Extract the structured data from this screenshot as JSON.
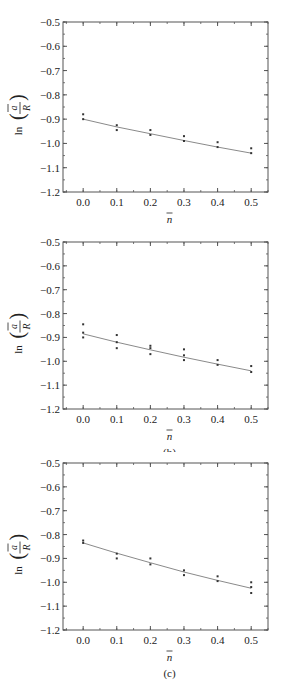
{
  "chart_data": [
    {
      "type": "scatter",
      "panel_label": "(a)",
      "xlabel": "n̄",
      "ylabel": "ln(ā/R)",
      "xlim": [
        -0.06,
        0.55
      ],
      "ylim": [
        -1.2,
        -0.5
      ],
      "x_ticks": [
        "0.0",
        "0.1",
        "0.2",
        "0.3",
        "0.4",
        "0.5"
      ],
      "y_ticks": [
        "-0.5",
        "-0.6",
        "-0.7",
        "-0.8",
        "-0.9",
        "-1.0",
        "-1.1",
        "-1.2"
      ],
      "grid": false,
      "series": [
        {
          "name": "data",
          "points": [
            [
              0.0,
              -0.88
            ],
            [
              0.0,
              -0.9
            ],
            [
              0.1,
              -0.925
            ],
            [
              0.1,
              -0.945
            ],
            [
              0.2,
              -0.945
            ],
            [
              0.2,
              -0.965
            ],
            [
              0.3,
              -0.97
            ],
            [
              0.3,
              -0.99
            ],
            [
              0.4,
              -0.995
            ],
            [
              0.4,
              -1.015
            ],
            [
              0.5,
              -1.02
            ],
            [
              0.5,
              -1.04
            ]
          ]
        },
        {
          "name": "fit",
          "type": "line",
          "points": [
            [
              0.0,
              -0.9
            ],
            [
              0.1,
              -0.932
            ],
            [
              0.2,
              -0.96
            ],
            [
              0.3,
              -0.988
            ],
            [
              0.4,
              -1.015
            ],
            [
              0.5,
              -1.04
            ]
          ]
        }
      ]
    },
    {
      "type": "scatter",
      "panel_label": "(b)",
      "xlabel": "n̄",
      "ylabel": "ln(ā/R)",
      "xlim": [
        -0.06,
        0.55
      ],
      "ylim": [
        -1.2,
        -0.5
      ],
      "x_ticks": [
        "0.0",
        "0.1",
        "0.2",
        "0.3",
        "0.4",
        "0.5"
      ],
      "y_ticks": [
        "-0.5",
        "-0.6",
        "-0.7",
        "-0.8",
        "-0.9",
        "-1.0",
        "-1.1",
        "-1.2"
      ],
      "grid": false,
      "series": [
        {
          "name": "data",
          "points": [
            [
              0.0,
              -0.845
            ],
            [
              0.0,
              -0.88
            ],
            [
              0.0,
              -0.9
            ],
            [
              0.1,
              -0.89
            ],
            [
              0.1,
              -0.92
            ],
            [
              0.1,
              -0.945
            ],
            [
              0.2,
              -0.935
            ],
            [
              0.2,
              -0.945
            ],
            [
              0.2,
              -0.97
            ],
            [
              0.3,
              -0.95
            ],
            [
              0.3,
              -0.975
            ],
            [
              0.3,
              -0.995
            ],
            [
              0.4,
              -0.995
            ],
            [
              0.4,
              -1.015
            ],
            [
              0.5,
              -1.02
            ],
            [
              0.5,
              -1.045
            ]
          ]
        },
        {
          "name": "fit",
          "type": "line",
          "points": [
            [
              0.0,
              -0.885
            ],
            [
              0.1,
              -0.92
            ],
            [
              0.2,
              -0.952
            ],
            [
              0.3,
              -0.983
            ],
            [
              0.4,
              -1.012
            ],
            [
              0.5,
              -1.04
            ]
          ]
        }
      ]
    },
    {
      "type": "scatter",
      "panel_label": "(c)",
      "xlabel": "n̄",
      "ylabel": "ln(ā/R)",
      "xlim": [
        -0.06,
        0.55
      ],
      "ylim": [
        -1.2,
        -0.5
      ],
      "x_ticks": [
        "0.0",
        "0.1",
        "0.2",
        "0.3",
        "0.4",
        "0.5"
      ],
      "y_ticks": [
        "-0.5",
        "-0.6",
        "-0.7",
        "-0.8",
        "-0.9",
        "-1.0",
        "-1.1",
        "-1.2"
      ],
      "grid": false,
      "series": [
        {
          "name": "data",
          "points": [
            [
              0.0,
              -0.825
            ],
            [
              0.0,
              -0.835
            ],
            [
              0.1,
              -0.88
            ],
            [
              0.1,
              -0.9
            ],
            [
              0.2,
              -0.9
            ],
            [
              0.2,
              -0.925
            ],
            [
              0.3,
              -0.95
            ],
            [
              0.3,
              -0.97
            ],
            [
              0.4,
              -0.975
            ],
            [
              0.4,
              -0.995
            ],
            [
              0.5,
              -1.0
            ],
            [
              0.5,
              -1.02
            ],
            [
              0.5,
              -1.045
            ]
          ]
        },
        {
          "name": "fit",
          "type": "line",
          "points": [
            [
              0.0,
              -0.835
            ],
            [
              0.1,
              -0.878
            ],
            [
              0.2,
              -0.918
            ],
            [
              0.3,
              -0.957
            ],
            [
              0.4,
              -0.992
            ],
            [
              0.5,
              -1.025
            ]
          ]
        }
      ]
    }
  ],
  "colors": {
    "axis": "#555555",
    "fit_line": "#8a8a8a",
    "points": "#333333"
  }
}
